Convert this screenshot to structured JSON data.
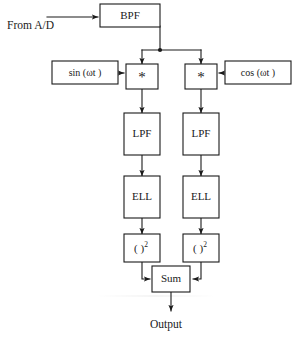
{
  "diagram": {
    "input_label": "From A/D",
    "output_label": "Output",
    "blocks": {
      "bpf": "BPF",
      "sin_osc": "sin (ωt )",
      "cos_osc": "cos (ωt )",
      "mult_left": "*",
      "mult_right": "*",
      "lpf_left": "LPF",
      "lpf_right": "LPF",
      "ell_left": "ELL",
      "ell_right": "ELL",
      "square_left_base": "( )",
      "square_left_exp": "2",
      "square_right_base": "( )",
      "square_right_exp": "2",
      "sum": "Sum"
    },
    "colors": {
      "line": "#1a1a1a",
      "box_fill": "#ffffff",
      "background": "#ffffff",
      "text": "#1a1a1a"
    }
  }
}
